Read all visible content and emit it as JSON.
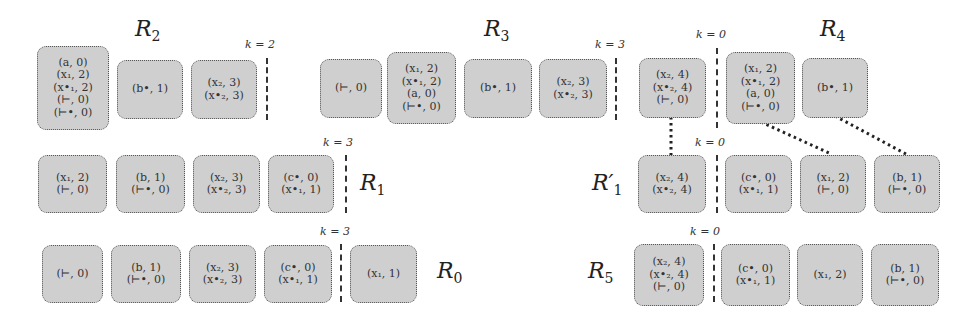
{
  "diagram": {
    "labels": {
      "R2": "R",
      "R2_sub": "2",
      "R3": "R",
      "R3_sub": "3",
      "R4": "R",
      "R4_sub": "4",
      "R1": "R",
      "R1_sub": "1",
      "R1p": "R′",
      "R1p_sub": "1",
      "R0": "R",
      "R0_sub": "0",
      "R5": "R",
      "R5_sub": "5"
    },
    "k_labels": {
      "R2": "k = 2",
      "R3": "k = 3",
      "R4": "k = 0",
      "R1": "k = 3",
      "R1p": "k = 0",
      "R0": "k = 3",
      "R5": "k = 0"
    },
    "rows": {
      "R2": [
        [
          "(a, 0)",
          "(x₁, 2)",
          "(x•₁, 2)",
          "(⊢, 0)",
          "(⊢•, 0)"
        ],
        [
          "(b•, 1)"
        ],
        [
          "(x₂, 3)",
          "(x•₂, 3)"
        ]
      ],
      "R3": [
        [
          "(⊢, 0)"
        ],
        [
          "(x₁, 2)",
          "(x•₁, 2)",
          "(a, 0)",
          "(⊢•, 0)"
        ],
        [
          "(b•, 1)"
        ],
        [
          "(x₂, 3)",
          "(x•₂, 3)"
        ]
      ],
      "R4": [
        [
          "(x₂, 4)",
          "(x•₂, 4)",
          "(⊢, 0)"
        ],
        [
          "(x₁, 2)",
          "(x•₁, 2)",
          "(a, 0)",
          "(⊢•, 0)"
        ],
        [
          "(b•, 1)"
        ]
      ],
      "R1": [
        [
          "(x₁, 2)",
          "(⊢, 0)"
        ],
        [
          "(b, 1)",
          "(⊢•, 0)"
        ],
        [
          "(x₂, 3)",
          "(x•₂, 3)"
        ],
        [
          "(c•, 0)",
          "(x•₁, 1)"
        ]
      ],
      "R1p": [
        [
          "(x₂, 4)",
          "(x•₂, 4)"
        ],
        [
          "(c•, 0)",
          "(x•₁, 1)"
        ],
        [
          "(x₁, 2)",
          "(⊢, 0)"
        ],
        [
          "(b, 1)",
          "(⊢•, 0)"
        ]
      ],
      "R0": [
        [
          "(⊢, 0)"
        ],
        [
          "(b, 1)",
          "(⊢•, 0)"
        ],
        [
          "(x₂, 3)",
          "(x•₂, 3)"
        ],
        [
          "(c•, 0)",
          "(x•₁, 1)"
        ],
        [
          "(x₁, 1)"
        ]
      ],
      "R5": [
        [
          "(x₂, 4)",
          "(x•₂, 4)",
          "(⊢, 0)"
        ],
        [
          "(c•, 0)",
          "(x•₁, 1)"
        ],
        [
          "(x₁, 2)"
        ],
        [
          "(b, 1)",
          "(⊢•, 0)"
        ]
      ]
    },
    "colors": {
      "box_fill": "#cfcfcf",
      "box_border": "#555555",
      "link": "#222222"
    }
  }
}
